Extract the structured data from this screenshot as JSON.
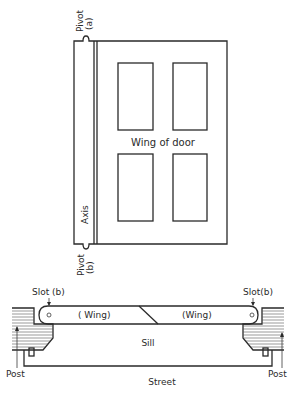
{
  "diagram": {
    "door": {
      "wing_label": "Wing of door",
      "axis_label": "Axis",
      "pivot_top_label": [
        "Pivot",
        "(a)"
      ],
      "pivot_bottom_label": [
        "Pivot",
        "(b)"
      ],
      "panels": 4
    },
    "plan": {
      "slot_left_label": "Slot (b)",
      "slot_right_label": "Slot(b)",
      "wing_left_label": "( Wing)",
      "wing_right_label": "(Wing)",
      "sill_label": "Sill",
      "street_label": "Street",
      "post_left_label": "Post",
      "post_right_label": "Post"
    },
    "colors": {
      "ink": "#2a2a2a",
      "background": "#ffffff"
    }
  }
}
